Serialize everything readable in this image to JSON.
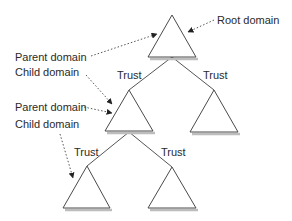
{
  "diagram": {
    "type": "domain-trust-tree",
    "labels": {
      "root": "Root domain",
      "parent_1": "Parent domain",
      "child_1": "Child domain",
      "parent_2": "Parent domain",
      "child_2": "Child domain",
      "trust_1": "Trust",
      "trust_2": "Trust",
      "trust_3": "Trust",
      "trust_4": "Trust"
    },
    "nodes": [
      {
        "id": "root",
        "shape": "triangle",
        "level": 0
      },
      {
        "id": "mid-left",
        "shape": "triangle",
        "level": 1
      },
      {
        "id": "mid-right",
        "shape": "triangle",
        "level": 1
      },
      {
        "id": "bottom-left",
        "shape": "triangle",
        "level": 2
      },
      {
        "id": "bottom-right",
        "shape": "triangle",
        "level": 2
      }
    ],
    "edges": [
      {
        "from": "root",
        "to": "mid-left",
        "label": "Trust"
      },
      {
        "from": "root",
        "to": "mid-right",
        "label": "Trust"
      },
      {
        "from": "mid-left",
        "to": "bottom-left",
        "label": "Trust"
      },
      {
        "from": "mid-left",
        "to": "bottom-right",
        "label": "Trust"
      }
    ],
    "colors": {
      "stroke": "#4a4a4a",
      "shadow": "#bdbdbd",
      "text": "#2a2a2a"
    }
  }
}
